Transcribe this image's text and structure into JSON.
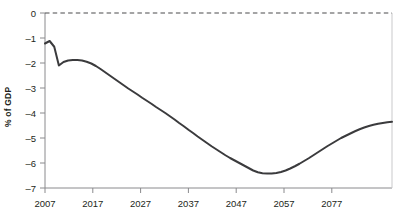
{
  "chart_data": {
    "type": "line",
    "title": "",
    "subtitle": "",
    "xlabel": "",
    "ylabel": "% of GDP",
    "xlim": [
      2007,
      2082
    ],
    "ylim": [
      -7,
      0
    ],
    "grid": false,
    "legend": null,
    "zero_reference_line": {
      "value": 0,
      "style": "dashed"
    },
    "x_ticks": [
      "2007",
      "2017",
      "2027",
      "2037",
      "2047",
      "2057",
      "2077"
    ],
    "x_tick_values": [
      2007,
      2017,
      2027,
      2037,
      2047,
      2057,
      2067
    ],
    "y_ticks": [
      "0",
      "–1",
      "–2",
      "–3",
      "–4",
      "–5",
      "–6",
      "–7"
    ],
    "y_tick_values": [
      0,
      -1,
      -2,
      -3,
      -4,
      -5,
      -6,
      -7
    ],
    "series": [
      {
        "name": "Deficit",
        "color": "#3b3b3d",
        "x": [
          2007,
          2008,
          2009,
          2010,
          2011,
          2012,
          2013,
          2014,
          2015,
          2016,
          2017,
          2018,
          2019,
          2020,
          2021,
          2022,
          2023,
          2024,
          2025,
          2026,
          2027,
          2028,
          2029,
          2030,
          2031,
          2032,
          2033,
          2034,
          2035,
          2036,
          2037,
          2038,
          2039,
          2040,
          2041,
          2042,
          2043,
          2044,
          2045,
          2046,
          2047,
          2048,
          2049,
          2050,
          2051,
          2052,
          2053,
          2054,
          2055,
          2056,
          2057,
          2058,
          2059,
          2060,
          2061,
          2062,
          2063,
          2064,
          2065,
          2066,
          2067,
          2068,
          2069,
          2070,
          2071,
          2072,
          2073,
          2074,
          2075,
          2076,
          2077,
          2078,
          2079,
          2080,
          2081,
          2082
        ],
        "values": [
          -1.22,
          -1.12,
          -1.35,
          -2.1,
          -1.96,
          -1.9,
          -1.88,
          -1.88,
          -1.9,
          -1.95,
          -2.02,
          -2.12,
          -2.24,
          -2.37,
          -2.5,
          -2.63,
          -2.76,
          -2.89,
          -3.02,
          -3.14,
          -3.26,
          -3.39,
          -3.51,
          -3.63,
          -3.76,
          -3.88,
          -4.0,
          -4.13,
          -4.26,
          -4.4,
          -4.53,
          -4.67,
          -4.8,
          -4.94,
          -5.07,
          -5.2,
          -5.33,
          -5.45,
          -5.57,
          -5.69,
          -5.8,
          -5.9,
          -6.0,
          -6.1,
          -6.2,
          -6.3,
          -6.37,
          -6.41,
          -6.42,
          -6.42,
          -6.4,
          -6.36,
          -6.3,
          -6.22,
          -6.13,
          -6.03,
          -5.92,
          -5.81,
          -5.69,
          -5.57,
          -5.45,
          -5.33,
          -5.22,
          -5.11,
          -5.0,
          -4.91,
          -4.82,
          -4.73,
          -4.65,
          -4.58,
          -4.52,
          -4.47,
          -4.43,
          -4.4,
          -4.37,
          -4.35
        ]
      }
    ]
  },
  "accent_colors": {
    "line": "#3b3b3d",
    "axis": "#8a8a8d",
    "text": "#231f20",
    "reference_line": "#4a4a4c"
  }
}
